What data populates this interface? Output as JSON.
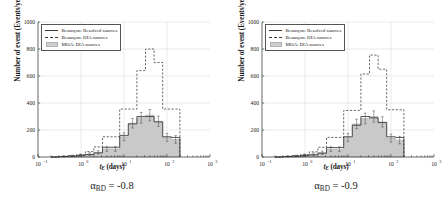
{
  "figure": {
    "panels": [
      {
        "id": "panel-left",
        "caption_alpha": "α",
        "caption_sub": "BD",
        "caption_value": " = -0.8",
        "caption_full": "αBD = -0.8",
        "ylabel": "Number of event (Events/year)",
        "xlabel_main": "t",
        "xlabel_sub": "E",
        "xlabel_unit": " (days)",
        "legend": [
          {
            "key": "solid",
            "label": "Besançon: Resolved sources"
          },
          {
            "key": "dashed",
            "label": "Besançon: DIA sources"
          },
          {
            "key": "patch",
            "label": "MOA: DIA sources"
          }
        ],
        "chart_data": {
          "type": "bar",
          "title": "",
          "xlabel": "t_E (days)",
          "ylabel": "Number of event (Events/year)",
          "xscale": "log",
          "yscale": "linear",
          "xlim": [
            0.1,
            1000
          ],
          "ylim": [
            0,
            1000
          ],
          "xticks": [
            0.1,
            1,
            10,
            100,
            1000
          ],
          "xtick_labels": [
            "10^-1",
            "10^0",
            "10^1",
            "10^2",
            "10^3"
          ],
          "yticks": [
            0,
            200,
            400,
            600,
            800,
            1000
          ],
          "ytick_labels": [
            "0",
            "200",
            "400",
            "600",
            "800",
            "1000"
          ],
          "grid": true,
          "legend_position": "upper left",
          "bin_edges_log10": [
            -0.7,
            -0.5,
            -0.3,
            -0.1,
            0.1,
            0.3,
            0.5,
            0.7,
            0.9,
            1.1,
            1.3,
            1.5,
            1.7,
            1.9,
            2.1,
            2.3
          ],
          "series": [
            {
              "name": "Besançon: Resolved sources",
              "style": "solid",
              "values": [
                0,
                3,
                6,
                10,
                18,
                30,
                72,
                72,
                160,
                245,
                300,
                300,
                260,
                150,
                145,
                18
              ]
            },
            {
              "name": "Besançon: DIA sources",
              "style": "dashed",
              "values": [
                0,
                5,
                10,
                18,
                40,
                75,
                150,
                150,
                355,
                355,
                640,
                800,
                700,
                355,
                355,
                145
              ]
            },
            {
              "name": "MOA: DIA sources",
              "style": "filled",
              "values": [
                0,
                4,
                8,
                14,
                22,
                35,
                60,
                60,
                150,
                250,
                290,
                310,
                265,
                145,
                130,
                15
              ],
              "errors": [
                0,
                4,
                6,
                8,
                10,
                12,
                18,
                18,
                30,
                35,
                40,
                42,
                38,
                30,
                28,
                12
              ]
            }
          ]
        }
      },
      {
        "id": "panel-right",
        "caption_alpha": "α",
        "caption_sub": "BD",
        "caption_value": " = -0.9",
        "caption_full": "αBD = -0.9",
        "ylabel": "Number of event (Events/year)",
        "xlabel_main": "t",
        "xlabel_sub": "E",
        "xlabel_unit": " (days)",
        "legend": [
          {
            "key": "solid",
            "label": "Besançon: Resolved sources"
          },
          {
            "key": "dashed",
            "label": "Besançon: DIA sources"
          },
          {
            "key": "patch",
            "label": "MOA: DIA sources"
          }
        ],
        "chart_data": {
          "type": "bar",
          "title": "",
          "xlabel": "t_E (days)",
          "ylabel": "Number of event (Events/year)",
          "xscale": "log",
          "yscale": "linear",
          "xlim": [
            0.1,
            1000
          ],
          "ylim": [
            0,
            1000
          ],
          "xticks": [
            0.1,
            1,
            10,
            100,
            1000
          ],
          "xtick_labels": [
            "10^-1",
            "10^0",
            "10^1",
            "10^2",
            "10^3"
          ],
          "yticks": [
            0,
            200,
            400,
            600,
            800,
            1000
          ],
          "ytick_labels": [
            "0",
            "200",
            "400",
            "600",
            "800",
            "1000"
          ],
          "grid": true,
          "legend_position": "upper left",
          "bin_edges_log10": [
            -0.7,
            -0.5,
            -0.3,
            -0.1,
            0.1,
            0.3,
            0.5,
            0.7,
            0.9,
            1.1,
            1.3,
            1.5,
            1.7,
            1.9,
            2.1,
            2.3
          ],
          "series": [
            {
              "name": "Besançon: Resolved sources",
              "style": "solid",
              "values": [
                0,
                3,
                6,
                10,
                16,
                28,
                70,
                70,
                150,
                235,
                300,
                290,
                255,
                150,
                145,
                20
              ]
            },
            {
              "name": "Besançon: DIA sources",
              "style": "dashed",
              "values": [
                0,
                5,
                10,
                18,
                38,
                72,
                145,
                145,
                345,
                345,
                615,
                755,
                650,
                350,
                350,
                140
              ]
            },
            {
              "name": "MOA: DIA sources",
              "style": "filled",
              "values": [
                0,
                4,
                8,
                13,
                20,
                32,
                58,
                58,
                145,
                245,
                285,
                300,
                260,
                140,
                125,
                15
              ],
              "errors": [
                0,
                4,
                6,
                8,
                10,
                12,
                18,
                18,
                30,
                35,
                40,
                42,
                38,
                30,
                28,
                12
              ]
            }
          ]
        }
      }
    ]
  }
}
